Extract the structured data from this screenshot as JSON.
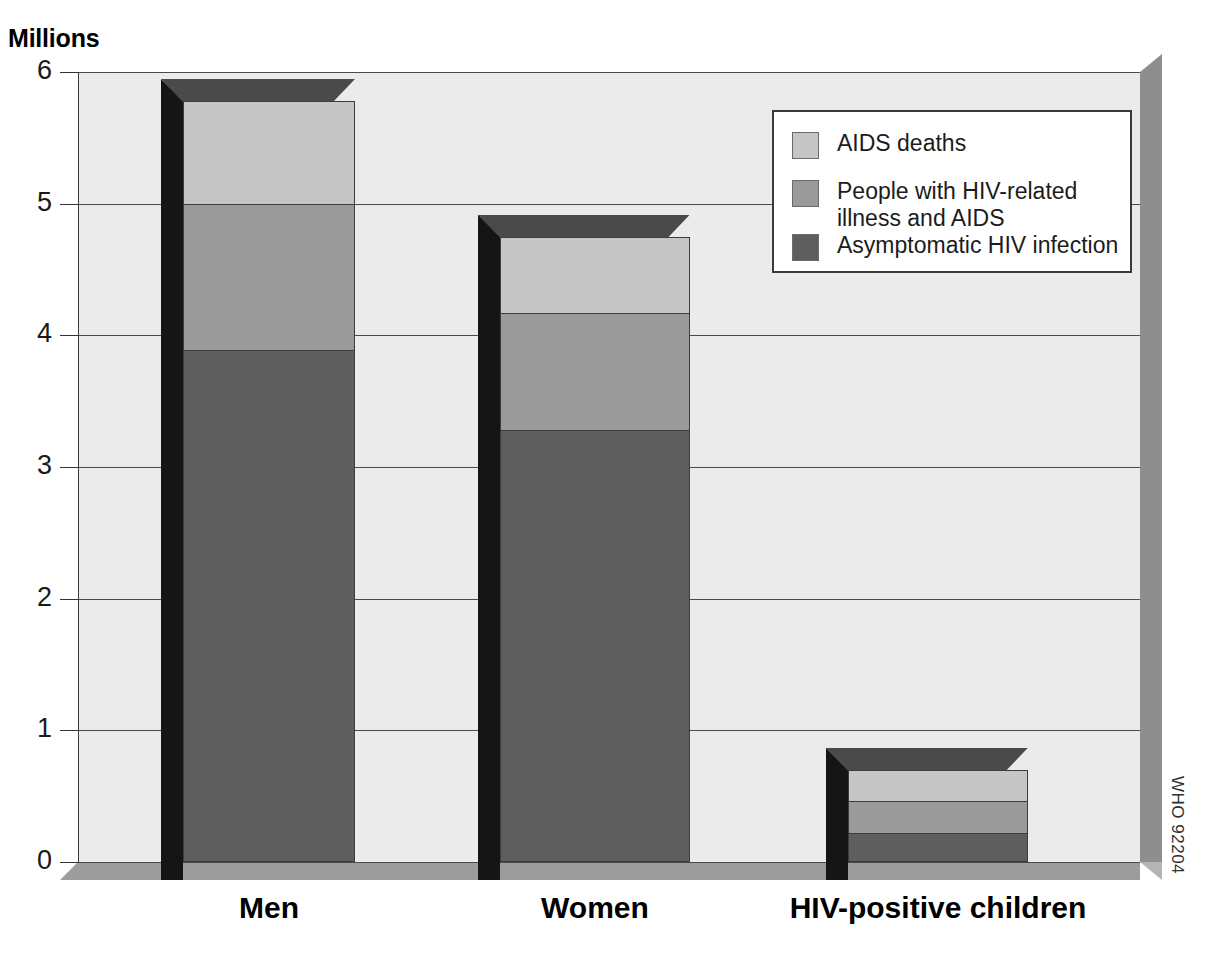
{
  "chart_data": {
    "type": "bar",
    "subtype": "stacked-column-3d",
    "title": "",
    "subtitle": "",
    "xlabel": "",
    "ylabel": "Millions",
    "ylim": [
      0,
      6
    ],
    "ytick_step": 1,
    "yticks": [
      "6",
      "5",
      "4",
      "3",
      "2",
      "1",
      "0"
    ],
    "grid": true,
    "grid_axis": "y",
    "legend_position": "top-right",
    "categories": [
      "Men",
      "Women",
      "HIV-positive children"
    ],
    "series": [
      {
        "name": "Asymptomatic HIV infection",
        "color": "#5e5e5e",
        "values": [
          3.89,
          3.28,
          0.22
        ]
      },
      {
        "name": "People with HIV-related\nillness and AIDS",
        "color": "#9a9a9a",
        "values": [
          1.11,
          0.89,
          0.24
        ]
      },
      {
        "name": "AIDS deaths",
        "color": "#c6c6c6",
        "values": [
          0.78,
          0.58,
          0.24
        ]
      }
    ],
    "totals": [
      5.78,
      4.75,
      0.7
    ],
    "annotations": [
      "WHO 92204"
    ]
  },
  "axis": {
    "unit_label": "Millions",
    "tick_labels": [
      "6",
      "5",
      "4",
      "3",
      "2",
      "1",
      "0"
    ]
  },
  "categories": [
    {
      "label": "Men"
    },
    {
      "label": "Women"
    },
    {
      "label": "HIV-positive children"
    }
  ],
  "legend": {
    "entries": [
      {
        "label": "AIDS deaths",
        "color": "#c6c6c6"
      },
      {
        "label": "People with HIV-related\nillness and AIDS",
        "color": "#9a9a9a"
      },
      {
        "label": "Asymptomatic HIV infection",
        "color": "#5e5e5e"
      }
    ]
  },
  "credit": {
    "text": "WHO 92204"
  },
  "colors": {
    "aids_deaths": "#c6c6c6",
    "hiv_illness": "#9a9a9a",
    "asymptomatic": "#5e5e5e",
    "plot_background": "#ebebeb",
    "floor": "#9c9c9c",
    "right_wall": "#8e8e8e",
    "bar_side": "#151515",
    "bar_top": "#4a4a4a"
  }
}
